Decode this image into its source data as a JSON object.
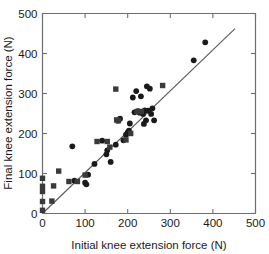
{
  "chart_data": {
    "type": "scatter",
    "title": "",
    "xlabel": "Initial knee extension force (N)",
    "ylabel": "Final knee extension force (N)",
    "xlim": [
      0,
      500
    ],
    "ylim": [
      0,
      500
    ],
    "xticks": [
      0,
      100,
      200,
      300,
      400,
      500
    ],
    "yticks": [
      0,
      100,
      200,
      300,
      400,
      500
    ],
    "xtick_labels": [
      "0",
      "100",
      "200",
      "300",
      "400",
      "500"
    ],
    "ytick_labels": [
      "0",
      "100",
      "200",
      "300",
      "400",
      "500"
    ],
    "grid": false,
    "legend": null,
    "series": [
      {
        "name": "circles",
        "marker": "circle",
        "color": "#1a1a1a",
        "points": [
          [
            70,
            168
          ],
          [
            75,
            82
          ],
          [
            100,
            77
          ],
          [
            103,
            73
          ],
          [
            107,
            97
          ],
          [
            122,
            124
          ],
          [
            140,
            182
          ],
          [
            150,
            148
          ],
          [
            152,
            158
          ],
          [
            160,
            129
          ],
          [
            172,
            172
          ],
          [
            177,
            232
          ],
          [
            182,
            237
          ],
          [
            190,
            183
          ],
          [
            196,
            197
          ],
          [
            200,
            203
          ],
          [
            203,
            207
          ],
          [
            205,
            225
          ],
          [
            212,
            290
          ],
          [
            216,
            253
          ],
          [
            220,
            306
          ],
          [
            224,
            256
          ],
          [
            228,
            252
          ],
          [
            231,
            293
          ],
          [
            236,
            249
          ],
          [
            238,
            224
          ],
          [
            240,
            258
          ],
          [
            243,
            233
          ],
          [
            245,
            318
          ],
          [
            248,
            257
          ],
          [
            252,
            312
          ],
          [
            255,
            249
          ],
          [
            258,
            263
          ],
          [
            262,
            233
          ],
          [
            355,
            383
          ],
          [
            382,
            428
          ]
        ]
      },
      {
        "name": "squares",
        "marker": "square",
        "color": "#3a3a3a",
        "points": [
          [
            0,
            8
          ],
          [
            0,
            30
          ],
          [
            0,
            55
          ],
          [
            0,
            68
          ],
          [
            0,
            88
          ],
          [
            22,
            31
          ],
          [
            26,
            69
          ],
          [
            38,
            106
          ],
          [
            62,
            80
          ],
          [
            82,
            80
          ],
          [
            100,
            96
          ],
          [
            128,
            180
          ],
          [
            152,
            180
          ],
          [
            158,
            166
          ],
          [
            172,
            311
          ],
          [
            174,
            234
          ],
          [
            178,
            232
          ],
          [
            196,
            184
          ],
          [
            207,
            200
          ],
          [
            222,
            255
          ],
          [
            232,
            255
          ],
          [
            282,
            320
          ]
        ]
      }
    ],
    "fit_line": {
      "x0": 0,
      "y0": 0,
      "x1": 452,
      "y1": 462
    }
  }
}
